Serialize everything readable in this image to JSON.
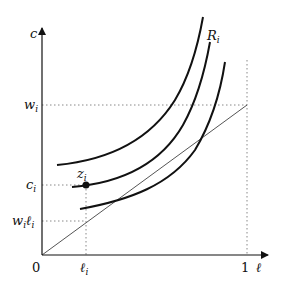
{
  "diagram": {
    "axes": {
      "y_label": "c",
      "x_label": "ℓ",
      "origin_label": "0",
      "x_tick_one": "1"
    },
    "y_ticks": [
      {
        "main": "w",
        "sub": "i",
        "name": "wi"
      },
      {
        "main": "c",
        "sub": "i",
        "name": "ci"
      },
      {
        "main": "w",
        "sub": "i",
        "main2": "ℓ",
        "sub2": "i",
        "name": "wili"
      }
    ],
    "x_ticks": [
      {
        "main": "ℓ",
        "sub": "i",
        "name": "li"
      }
    ],
    "point_label": {
      "main": "z",
      "sub": "i"
    },
    "curve_label": {
      "main": "R",
      "sub": "i"
    },
    "colors": {
      "axis": "#111111",
      "curve": "#111111",
      "line": "#555555",
      "dotted": "#888888"
    }
  }
}
